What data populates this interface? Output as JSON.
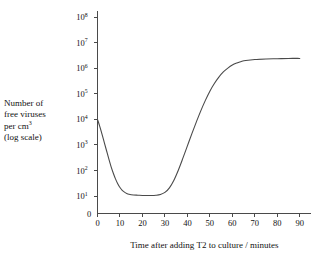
{
  "figure": {
    "background_color": "#ffffff",
    "ink_color": "#4a4a4a"
  },
  "ylabel": {
    "line1": "Number of",
    "line2": "free viruses",
    "line3_prefix": "per cm",
    "line3_sup": "3",
    "line4": "(log scale)"
  },
  "chart_data": {
    "type": "line",
    "title": "",
    "xlabel": "Time after adding T2 to culture / minutes",
    "ylabel": "Number of free viruses per cm3 (log scale)",
    "yscale": "log",
    "grid": false,
    "legend": null,
    "xlim": [
      0,
      95
    ],
    "ylim_exponent": [
      0,
      8
    ],
    "xticks": [
      0,
      10,
      20,
      30,
      40,
      50,
      60,
      70,
      80,
      90
    ],
    "xtick_labels": [
      "0",
      "10",
      "20",
      "30",
      "40",
      "50",
      "60",
      "70",
      "80",
      "90"
    ],
    "yticks_exponent": [
      1,
      2,
      3,
      4,
      5,
      6,
      7,
      8
    ],
    "ytick_labels": [
      "10",
      "10",
      "10",
      "10",
      "10",
      "10",
      "10",
      "10"
    ],
    "ytick_exponents": [
      "1",
      "2",
      "3",
      "4",
      "5",
      "6",
      "7",
      "8"
    ],
    "yzero_label": "0",
    "series": [
      {
        "name": "free virus concentration",
        "x": [
          0,
          1,
          2,
          3,
          4,
          5,
          6,
          7,
          8,
          9,
          10,
          11,
          12,
          13,
          14,
          16,
          18,
          20,
          22,
          24,
          26,
          28,
          30,
          32,
          34,
          36,
          38,
          40,
          42,
          44,
          46,
          48,
          50,
          52,
          54,
          56,
          58,
          60,
          62,
          64,
          66,
          70,
          75,
          80,
          85,
          90
        ],
        "y_exponent": [
          4.0,
          3.72,
          3.42,
          3.1,
          2.78,
          2.46,
          2.16,
          1.9,
          1.67,
          1.48,
          1.33,
          1.22,
          1.15,
          1.1,
          1.07,
          1.04,
          1.03,
          1.02,
          1.02,
          1.02,
          1.03,
          1.06,
          1.14,
          1.32,
          1.62,
          2.02,
          2.48,
          2.96,
          3.44,
          3.9,
          4.34,
          4.74,
          5.1,
          5.4,
          5.65,
          5.85,
          6.0,
          6.12,
          6.2,
          6.26,
          6.3,
          6.34,
          6.36,
          6.37,
          6.38,
          6.38
        ]
      }
    ],
    "annotations": []
  }
}
